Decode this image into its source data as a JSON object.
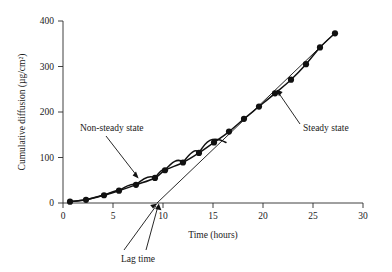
{
  "chart_data": {
    "type": "line",
    "title": "",
    "subtitle": "",
    "xlabel": "Time (hours)",
    "ylabel": "Cumulative diffusion (µg/cm²)",
    "xlim": [
      0,
      30
    ],
    "ylim": [
      0,
      400
    ],
    "xticks": [
      0,
      5,
      10,
      15,
      20,
      25,
      30
    ],
    "xtick_labels": [
      "0",
      "5",
      "10",
      "15",
      "20",
      "25",
      "30"
    ],
    "yticks": [
      0,
      100,
      200,
      300,
      400
    ],
    "ytick_labels": [
      "0",
      "100",
      "200",
      "300",
      "400"
    ],
    "grid": false,
    "legend": "none",
    "series": [
      {
        "name": "Cumulative diffusion",
        "marker": "filled-circle",
        "x": [
          0.7,
          2.3,
          4.1,
          5.6,
          7.3,
          9.2,
          10.2,
          12.0,
          13.6,
          15.1,
          16.6,
          18.1,
          19.6,
          21.2,
          22.8,
          24.3,
          25.7,
          27.2
        ],
        "y": [
          3,
          7,
          17,
          27,
          40,
          55,
          72,
          89,
          110,
          133,
          157,
          185,
          212,
          241,
          271,
          305,
          342,
          373
        ]
      },
      {
        "name": "Steady-state extrapolation line",
        "marker": "none",
        "x": [
          9.4,
          27.4
        ],
        "y": [
          0,
          378
        ]
      }
    ],
    "annotations": [
      {
        "id": "non-steady-state",
        "text": "Non-steady state",
        "text_x": 8.0,
        "text_y": 168,
        "arrow_to_x": 9.0,
        "arrow_to_y": 58
      },
      {
        "id": "steady-state",
        "text": "Steady state",
        "text_x": 24.4,
        "text_y": 168,
        "arrow_to_x": 22.6,
        "arrow_to_y": 281
      },
      {
        "id": "lag-time",
        "text": "Lag time",
        "text_x": 10.7,
        "text_y": -95,
        "arrow_to_x": 9.4,
        "arrow_to_y": 0
      }
    ],
    "lag_time_hours": 9.4
  },
  "figure": {
    "background_color": "#ffffff",
    "ink_color": "#111111",
    "axis_color": "#2b2b2b"
  }
}
